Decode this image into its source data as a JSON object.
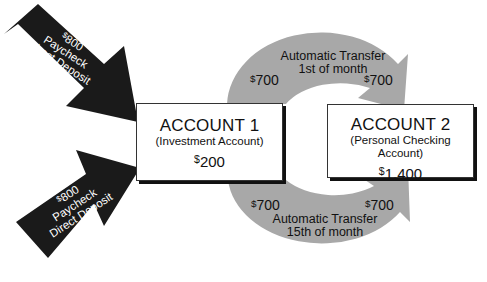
{
  "deposits": [
    {
      "currency": "$",
      "amount": "800",
      "line2": "Paycheck",
      "line3": "Direct Deposit"
    },
    {
      "currency": "$",
      "amount": "800",
      "line2": "Paycheck",
      "line3": "Direct Deposit"
    }
  ],
  "accounts": [
    {
      "title": "ACCOUNT 1",
      "subtitle": "(Investment Account)",
      "currency": "$",
      "balance": "200"
    },
    {
      "title": "ACCOUNT 2",
      "subtitle": "(Personal Checking Account)",
      "currency": "$",
      "balance": "1,400"
    }
  ],
  "transfers": [
    {
      "line1": "Automatic Transfer",
      "line2": "1st of month",
      "from_currency": "$",
      "from_amount": "700",
      "to_currency": "$",
      "to_amount": "700"
    },
    {
      "line1": "Automatic Transfer",
      "line2": "15th of month",
      "from_currency": "$",
      "from_amount": "700",
      "to_currency": "$",
      "to_amount": "700"
    }
  ],
  "colors": {
    "deposit_arrow": "#1a1a1a",
    "transfer_arrow": "#a6a6a6",
    "box_border": "#333333"
  }
}
